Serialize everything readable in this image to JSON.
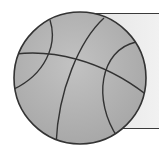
{
  "illustration": {
    "subject": "basketball",
    "icon": "basketball-icon",
    "style": "grayscale line art",
    "colors": {
      "ball_fill": "#b0b0b0",
      "ball_stroke": "#333333",
      "card_fill": "#ececec",
      "card_stroke": "#3a3a3a",
      "background": "#ffffff"
    }
  }
}
